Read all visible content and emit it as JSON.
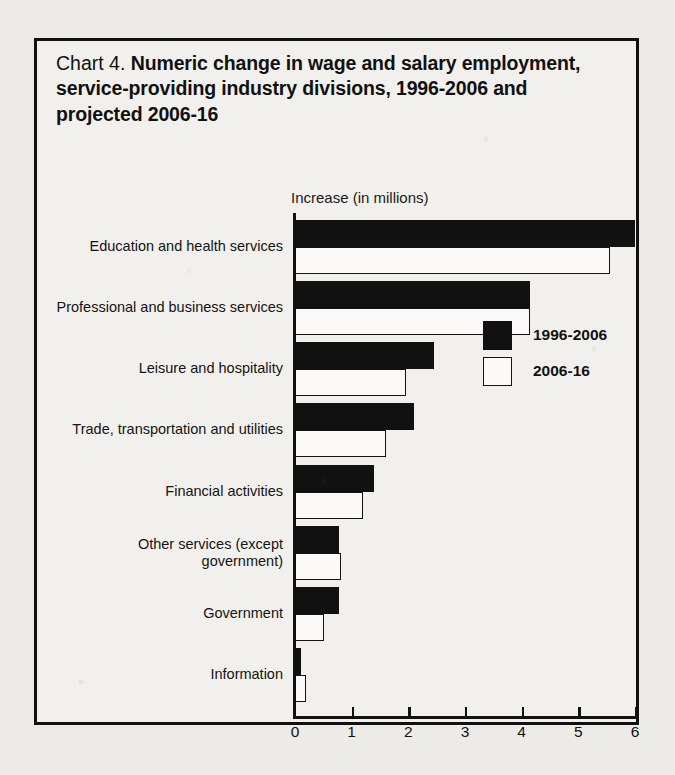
{
  "chart_data": {
    "type": "bar",
    "orientation": "horizontal",
    "title": "Chart 4. Numeric change in wage and salary employment, service-providing industry divisions, 1996-2006 and projected 2006-16",
    "title_prefix": "Chart 4.",
    "title_main": "Numeric change in wage and salary employment, service-providing industry divisions, 1996-2006 and projected 2006-16",
    "xlabel": "Increase (in millions)",
    "ylabel": "",
    "xlim": [
      0,
      6
    ],
    "xticks": [
      0,
      1,
      2,
      3,
      4,
      5,
      6
    ],
    "xtick_labels": [
      "0",
      "1",
      "2",
      "3",
      "4",
      "5",
      "6"
    ],
    "grid": false,
    "legend_position": "center-right",
    "categories": [
      "Education and health services",
      "Professional and business services",
      "Leisure and hospitality",
      "Trade, transportation and utilities",
      "Financial activities",
      "Other services (except government)",
      "Government",
      "Information"
    ],
    "category_lines": [
      [
        "Education and health services"
      ],
      [
        "Professional and business services"
      ],
      [
        "Leisure and hospitality"
      ],
      [
        "Trade, transportation and utilities"
      ],
      [
        "Financial activities"
      ],
      [
        "Other services (except",
        "government)"
      ],
      [
        "Government"
      ],
      [
        "Information"
      ]
    ],
    "series": [
      {
        "name": "1996-2006",
        "color": "#111111",
        "style": "filled",
        "values": [
          6.0,
          4.15,
          2.45,
          2.1,
          1.4,
          0.78,
          0.78,
          0.1
        ]
      },
      {
        "name": "2006-16",
        "color": "#ffffff",
        "style": "hollow",
        "values": [
          5.55,
          4.15,
          1.95,
          1.6,
          1.2,
          0.82,
          0.52,
          0.2
        ]
      }
    ]
  },
  "legend": {
    "items": [
      {
        "label": "1996-2006"
      },
      {
        "label": "2006-16"
      }
    ]
  },
  "colors": {
    "ink": "#111111",
    "paper": "#f2f0ec",
    "page": "#edebe7"
  }
}
